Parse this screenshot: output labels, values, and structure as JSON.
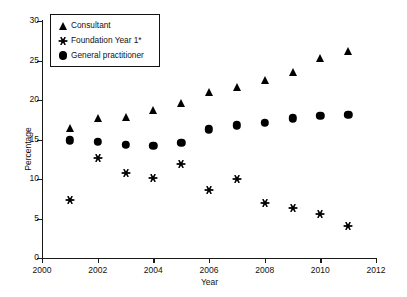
{
  "chart_data": {
    "type": "scatter",
    "title": "",
    "xlabel": "Year",
    "ylabel": "Percentage",
    "xlim": [
      2000,
      2012
    ],
    "ylim": [
      0,
      30
    ],
    "xticks": [
      2000,
      2002,
      2004,
      2006,
      2008,
      2010,
      2012
    ],
    "yticks": [
      0,
      5,
      10,
      15,
      20,
      25,
      30
    ],
    "grid": false,
    "legend_position": "top-left",
    "x": [
      2001,
      2002,
      2003,
      2004,
      2005,
      2006,
      2007,
      2008,
      2009,
      2010,
      2011
    ],
    "series": [
      {
        "name": "Consultant",
        "marker": "triangle",
        "color": "#000000",
        "values": [
          16.4,
          17.7,
          17.8,
          18.7,
          19.6,
          21.0,
          21.7,
          22.5,
          23.5,
          25.3,
          26.2
        ]
      },
      {
        "name": "Foundation Year 1*",
        "marker": "star",
        "color": "#000000",
        "values": [
          7.4,
          12.7,
          10.7,
          10.1,
          11.9,
          8.6,
          10.0,
          7.0,
          6.3,
          5.6,
          4.0
        ]
      },
      {
        "name": "General practitioner",
        "marker": "circle",
        "color": "#000000",
        "values": [
          14.9,
          14.7,
          14.3,
          14.2,
          14.6,
          16.3,
          16.8,
          17.1,
          17.7,
          18.0,
          18.1
        ]
      }
    ]
  },
  "axis": {
    "x_tick_labels": [
      "2000",
      "2002",
      "2004",
      "2006",
      "2008",
      "2010",
      "2012"
    ],
    "y_tick_labels": [
      "0",
      "5",
      "10",
      "15",
      "20",
      "25",
      "30"
    ],
    "x_axis_title": "Year",
    "y_axis_title": "Percentage"
  },
  "legend": {
    "entries": [
      {
        "label": "Consultant",
        "marker": "triangle-icon"
      },
      {
        "label": "Foundation Year 1*",
        "marker": "star-icon"
      },
      {
        "label": "General practitioner",
        "marker": "circle-icon"
      }
    ]
  }
}
